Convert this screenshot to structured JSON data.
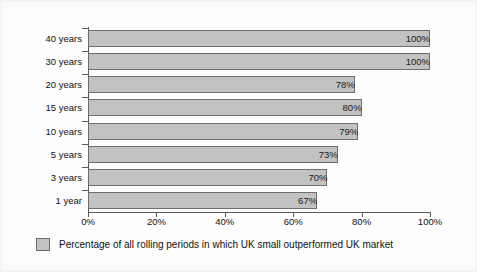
{
  "chart_data": {
    "type": "bar",
    "orientation": "horizontal",
    "title": "",
    "subtitle": "",
    "xlabel": "",
    "ylabel": "",
    "categories": [
      "40 years",
      "30 years",
      "20 years",
      "15 years",
      "10 years",
      "5 years",
      "3 years",
      "1 year"
    ],
    "values": [
      100,
      100,
      78,
      80,
      79,
      73,
      70,
      67
    ],
    "data_labels": [
      "100%",
      "100%",
      "78%",
      "80%",
      "79%",
      "73%",
      "70%",
      "67%"
    ],
    "xlim": [
      0,
      100
    ],
    "xticks": [
      0,
      20,
      40,
      60,
      80,
      100
    ],
    "xtick_labels": [
      "0%",
      "20%",
      "40%",
      "60%",
      "80%",
      "100%"
    ],
    "grid": false,
    "legend_position": "bottom-left",
    "series": [
      {
        "name": "Percentage of all rolling periods in which UK small outperformed UK market",
        "values": [
          100,
          100,
          78,
          80,
          79,
          73,
          70,
          67
        ],
        "color": "#c2c2c2"
      }
    ]
  },
  "legend": {
    "label": "Percentage of all rolling periods in which UK small outperformed UK market",
    "swatch_color": "#c2c2c2",
    "swatch_border": "#6d6e70"
  },
  "colors": {
    "bar_fill": "#c2c2c2",
    "bar_border": "#6d6e70",
    "axis": "#58595b",
    "text": "#111111",
    "background": "#fdfdfd"
  }
}
